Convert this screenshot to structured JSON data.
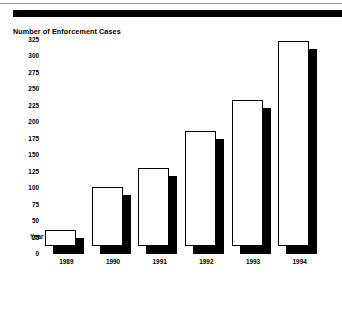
{
  "header": {
    "top_rule": "horizontal-rule",
    "black_bar": "solid-black-band"
  },
  "chart_data": {
    "type": "bar",
    "title": "Number of Enforcement Cases",
    "xlabel": "Year",
    "ylabel": "",
    "categories": [
      "1989",
      "1990",
      "1991",
      "1992",
      "1993",
      "1994"
    ],
    "values": [
      25,
      90,
      118,
      175,
      222,
      312
    ],
    "ylim": [
      0,
      325
    ],
    "ytick_step": 25,
    "yticks": [
      "325",
      "300",
      "275",
      "250",
      "225",
      "200",
      "175",
      "150",
      "125",
      "100",
      "75",
      "50",
      "25",
      "0"
    ],
    "grid": false,
    "legend": null,
    "style": "3d-extruded-bars",
    "bar_face_color": "#ffffff",
    "bar_edge_color": "#000000",
    "bar_shadow_color": "#000000"
  }
}
